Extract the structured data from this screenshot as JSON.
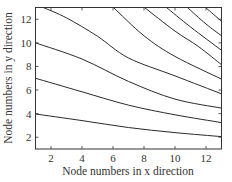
{
  "chart_data": {
    "type": "contour",
    "title": "",
    "xlabel": "Node numbers in x direction",
    "ylabel": "Node numbers in y direction",
    "xlim": [
      1,
      13
    ],
    "ylim": [
      1,
      13
    ],
    "xticks": [
      2,
      4,
      6,
      8,
      10,
      12
    ],
    "yticks": [
      2,
      4,
      6,
      8,
      10,
      12
    ],
    "grid": false,
    "legend": null,
    "line_color": "#2a2a2a",
    "series": [
      {
        "name": "contour-1",
        "points": [
          [
            1,
            3.97
          ],
          [
            4,
            3.41
          ],
          [
            7,
            2.82
          ],
          [
            10,
            2.39
          ],
          [
            13,
            2.05
          ]
        ]
      },
      {
        "name": "contour-2",
        "points": [
          [
            1,
            7.0
          ],
          [
            4,
            5.85
          ],
          [
            7,
            4.72
          ],
          [
            10,
            3.9
          ],
          [
            13,
            3.24
          ]
        ]
      },
      {
        "name": "contour-3",
        "points": [
          [
            1,
            10.0
          ],
          [
            4,
            8.63
          ],
          [
            7,
            6.73
          ],
          [
            10,
            5.23
          ],
          [
            13,
            4.47
          ]
        ]
      },
      {
        "name": "contour-4",
        "points": [
          [
            1.5,
            13.0
          ],
          [
            3,
            12.12
          ],
          [
            5,
            10.56
          ],
          [
            7,
            8.72
          ],
          [
            10,
            7.2
          ],
          [
            13,
            5.68
          ]
        ]
      },
      {
        "name": "contour-5",
        "points": [
          [
            6.03,
            13.0
          ],
          [
            8,
            10.6
          ],
          [
            10,
            8.85
          ],
          [
            13,
            6.93
          ]
        ]
      },
      {
        "name": "contour-6",
        "points": [
          [
            8.03,
            13.0
          ],
          [
            10,
            11.0
          ],
          [
            11.5,
            9.7
          ],
          [
            13,
            8.15
          ]
        ]
      },
      {
        "name": "contour-7",
        "points": [
          [
            9.45,
            13.0
          ],
          [
            11,
            11.35
          ],
          [
            13,
            9.37
          ]
        ]
      },
      {
        "name": "contour-8",
        "points": [
          [
            10.8,
            13.0
          ],
          [
            12,
            11.6
          ],
          [
            13,
            10.6
          ]
        ]
      },
      {
        "name": "contour-9",
        "points": [
          [
            11.97,
            13.0
          ],
          [
            12.5,
            12.4
          ],
          [
            13,
            11.83
          ]
        ]
      }
    ]
  }
}
